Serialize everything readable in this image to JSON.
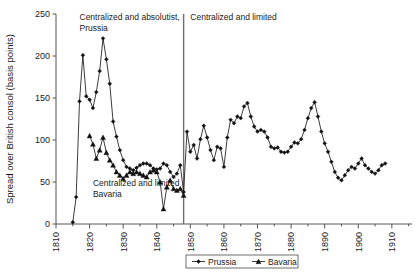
{
  "chart_data": {
    "type": "line",
    "title": "",
    "xlabel": "",
    "ylabel": "Spread over British consol (basis points)",
    "xlim": [
      1810,
      1916
    ],
    "ylim": [
      0,
      250
    ],
    "ytick_labels": [
      "0",
      "50",
      "100",
      "150",
      "200",
      "250"
    ],
    "yticks": [
      0,
      50,
      100,
      150,
      200,
      250
    ],
    "xtick_labels": [
      "1810",
      "1820",
      "1830",
      "1840",
      "1850",
      "1860",
      "1870",
      "1880",
      "1890",
      "1900",
      "1910"
    ],
    "xticks": [
      1810,
      1820,
      1830,
      1840,
      1850,
      1860,
      1870,
      1880,
      1890,
      1900,
      1910
    ],
    "minor_xticks": [
      1815,
      1825,
      1835,
      1845,
      1855,
      1865,
      1875,
      1885,
      1895,
      1905,
      1915
    ],
    "grid": false,
    "legend_position": "bottom-center",
    "annotations": [
      {
        "name": "annotation-prussia-absolutist",
        "text_line1": "Centralized and absolutist,",
        "text_line2": "Prussia",
        "x": 1817,
        "y": 243
      },
      {
        "name": "annotation-bavaria-limited",
        "text_line1": "Centralized and limited",
        "text_line2": "Bavaria",
        "x": 1821,
        "y": 45
      },
      {
        "name": "annotation-centralized-limited-right",
        "text_line1": "Centralized and limited",
        "text_line2": "",
        "x": 1850,
        "y": 243
      }
    ],
    "divider": {
      "name": "divider-1848",
      "x": 1848,
      "label": ""
    },
    "series": [
      {
        "name": "Prussia",
        "marker": "diamond",
        "color": "#111111",
        "points": [
          [
            1815,
            2
          ],
          [
            1816,
            32
          ],
          [
            1817,
            146
          ],
          [
            1818,
            201
          ],
          [
            1819,
            152
          ],
          [
            1820,
            148
          ],
          [
            1821,
            138
          ],
          [
            1822,
            157
          ],
          [
            1823,
            182
          ],
          [
            1824,
            221
          ],
          [
            1825,
            196
          ],
          [
            1826,
            167
          ],
          [
            1827,
            122
          ],
          [
            1828,
            104
          ],
          [
            1829,
            88
          ],
          [
            1830,
            76
          ],
          [
            1831,
            68
          ],
          [
            1832,
            66
          ],
          [
            1833,
            64
          ],
          [
            1834,
            67
          ],
          [
            1835,
            70
          ],
          [
            1836,
            72
          ],
          [
            1837,
            72
          ],
          [
            1838,
            70
          ],
          [
            1839,
            66
          ],
          [
            1840,
            65
          ],
          [
            1841,
            66
          ],
          [
            1842,
            72
          ],
          [
            1843,
            70
          ],
          [
            1844,
            62
          ],
          [
            1845,
            56
          ],
          [
            1846,
            60
          ],
          [
            1847,
            70
          ],
          [
            1848,
            38
          ],
          [
            1849,
            110
          ],
          [
            1850,
            86
          ],
          [
            1851,
            94
          ],
          [
            1852,
            78
          ],
          [
            1853,
            101
          ],
          [
            1854,
            117
          ],
          [
            1855,
            103
          ],
          [
            1856,
            88
          ],
          [
            1857,
            76
          ],
          [
            1858,
            92
          ],
          [
            1859,
            90
          ],
          [
            1860,
            68
          ],
          [
            1861,
            103
          ],
          [
            1862,
            124
          ],
          [
            1863,
            120
          ],
          [
            1864,
            128
          ],
          [
            1865,
            126
          ],
          [
            1866,
            140
          ],
          [
            1867,
            144
          ],
          [
            1868,
            128
          ],
          [
            1869,
            116
          ],
          [
            1870,
            110
          ],
          [
            1871,
            112
          ],
          [
            1872,
            110
          ],
          [
            1873,
            103
          ],
          [
            1874,
            92
          ],
          [
            1875,
            90
          ],
          [
            1876,
            91
          ],
          [
            1877,
            86
          ],
          [
            1878,
            85
          ],
          [
            1879,
            86
          ],
          [
            1880,
            92
          ],
          [
            1881,
            97
          ],
          [
            1882,
            96
          ],
          [
            1883,
            101
          ],
          [
            1884,
            112
          ],
          [
            1885,
            126
          ],
          [
            1886,
            138
          ],
          [
            1887,
            145
          ],
          [
            1888,
            128
          ],
          [
            1889,
            110
          ],
          [
            1890,
            96
          ],
          [
            1891,
            86
          ],
          [
            1892,
            74
          ],
          [
            1893,
            62
          ],
          [
            1894,
            55
          ],
          [
            1895,
            52
          ],
          [
            1896,
            58
          ],
          [
            1897,
            64
          ],
          [
            1898,
            68
          ],
          [
            1899,
            66
          ],
          [
            1900,
            72
          ],
          [
            1901,
            78
          ],
          [
            1902,
            70
          ],
          [
            1903,
            66
          ],
          [
            1904,
            62
          ],
          [
            1905,
            60
          ],
          [
            1906,
            64
          ],
          [
            1907,
            70
          ],
          [
            1908,
            72
          ]
        ]
      },
      {
        "name": "Bavaria",
        "marker": "triangle",
        "color": "#111111",
        "points": [
          [
            1820,
            105
          ],
          [
            1821,
            95
          ],
          [
            1822,
            78
          ],
          [
            1823,
            88
          ],
          [
            1824,
            103
          ],
          [
            1825,
            85
          ],
          [
            1826,
            76
          ],
          [
            1827,
            70
          ],
          [
            1828,
            62
          ],
          [
            1829,
            58
          ],
          [
            1830,
            54
          ],
          [
            1831,
            58
          ],
          [
            1832,
            62
          ],
          [
            1833,
            60
          ],
          [
            1834,
            62
          ],
          [
            1835,
            60
          ],
          [
            1836,
            58
          ],
          [
            1837,
            56
          ],
          [
            1838,
            62
          ],
          [
            1839,
            64
          ],
          [
            1840,
            62
          ],
          [
            1841,
            50
          ],
          [
            1842,
            18
          ],
          [
            1843,
            44
          ],
          [
            1844,
            52
          ],
          [
            1845,
            42
          ],
          [
            1846,
            40
          ],
          [
            1847,
            42
          ],
          [
            1848,
            34
          ]
        ]
      }
    ]
  },
  "legend": {
    "entries": [
      {
        "label": "Prussia",
        "marker": "diamond"
      },
      {
        "label": "Bavaria",
        "marker": "triangle"
      }
    ]
  }
}
